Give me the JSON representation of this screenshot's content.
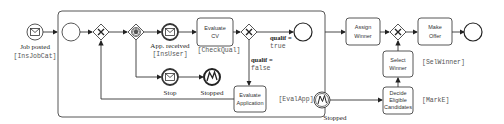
{
  "diagram": {
    "type": "BPMN process",
    "start_event": {
      "label": "Job posted",
      "annotation": "[InsJobCat]",
      "icon": "envelope-icon"
    },
    "subprocess": {
      "inner_start": {
        "label": ""
      },
      "message_event": {
        "label": "App. received",
        "annotation": "[InsUser]",
        "icon": "envelope-icon"
      },
      "evaluate_cv": {
        "line1": "Evaluate",
        "line2": "CV",
        "annotation": "[CheckQual]"
      },
      "gateway_true": {
        "condition": "qualif =",
        "value": "true"
      },
      "gateway_false": {
        "condition": "qualif =",
        "value": "false"
      },
      "stop_event": {
        "label": "Stop",
        "icon": "envelope-icon"
      },
      "stopped_end": {
        "label": "Stopped",
        "icon": "error-icon"
      },
      "evaluate_application": {
        "line1": "Evaluate",
        "line2": "Application",
        "annotation": "[EvalApp]"
      }
    },
    "boundary_event": {
      "label": "Stopped",
      "icon": "error-icon"
    },
    "assign_winner": {
      "line1": "Assign",
      "line2": "Winner"
    },
    "make_offer": {
      "line1": "Make",
      "line2": "Offer"
    },
    "select_winner": {
      "line1": "Select",
      "line2": "Winner",
      "annotation": "[SelWinner]"
    },
    "decide_eligible": {
      "line1": "Decide",
      "line2": "Eligible",
      "line3": "Candidates",
      "annotation": "[MarkE]"
    }
  }
}
